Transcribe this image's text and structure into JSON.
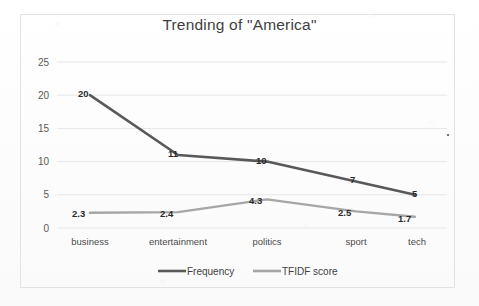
{
  "chart_data": {
    "type": "line",
    "title": "Trending of \"America\"",
    "xlabel": "",
    "ylabel": "",
    "categories": [
      "business",
      "entertainment",
      "politics",
      "sport",
      "tech"
    ],
    "series": [
      {
        "name": "Frequency",
        "color": "#595959",
        "values": [
          20,
          11,
          10,
          7,
          5
        ],
        "labels": [
          "20",
          "11",
          "10",
          "7",
          "5"
        ]
      },
      {
        "name": "TFIDF score",
        "color": "#a6a6a6",
        "values": [
          2.3,
          2.4,
          4.3,
          2.5,
          1.7
        ],
        "labels": [
          "2.3",
          "2.4",
          "4.3",
          "2.5",
          "1.7"
        ]
      }
    ],
    "ylim": [
      0,
      25
    ],
    "yticks": [
      0,
      5,
      10,
      15,
      20,
      25
    ],
    "ytick_labels": [
      "0",
      "5",
      "10",
      "15",
      "20",
      "25"
    ],
    "grid": true,
    "legend_position": "bottom-center",
    "data_labels_shown": true
  },
  "axes": {
    "y_tick_labels": [
      "25",
      "20",
      "15",
      "10",
      "5",
      "0"
    ]
  },
  "categories": {
    "c0": "business",
    "c1": "entertainment",
    "c2": "politics",
    "c3": "sport",
    "c4": "tech"
  },
  "series_frequency": {
    "name": "Frequency",
    "l0": "20",
    "l1": "11",
    "l2": "10",
    "l3": "7",
    "l4": "5"
  },
  "series_tfidf": {
    "name": "TFIDF score",
    "l0": "2.3",
    "l1": "2.4",
    "l2": "4.3",
    "l3": "2.5",
    "l4": "1.7"
  },
  "legend": {
    "item0": "Frequency",
    "item1": "TFIDF score"
  },
  "colors": {
    "frequency": "#595959",
    "tfidf": "#a6a6a6",
    "grid": "#e6e6e6",
    "border": "#e2e2e2",
    "title": "#3f3f3f"
  }
}
